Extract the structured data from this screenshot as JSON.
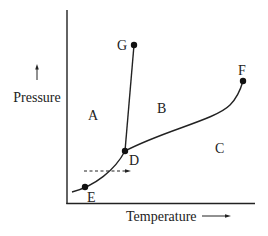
{
  "diagram": {
    "type": "phase-diagram",
    "axes": {
      "x_label": "Temperature",
      "y_label": "Pressure"
    },
    "regions": [
      {
        "id": "A",
        "label": "A"
      },
      {
        "id": "B",
        "label": "B"
      },
      {
        "id": "C",
        "label": "C"
      }
    ],
    "points": [
      {
        "id": "D",
        "label": "D"
      },
      {
        "id": "E",
        "label": "E"
      },
      {
        "id": "F",
        "label": "F"
      },
      {
        "id": "G",
        "label": "G"
      }
    ],
    "colors": {
      "line": "#222222",
      "background": "#ffffff"
    }
  }
}
